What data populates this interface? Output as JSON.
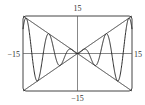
{
  "chart_data": {
    "type": "line",
    "title": "",
    "xlabel": "",
    "ylabel": "",
    "xlim": [
      -15,
      15
    ],
    "ylim": [
      -15,
      15
    ],
    "grid": false,
    "legend": null,
    "tick_labels": {
      "x_left": "−15",
      "x_right": "15",
      "y_top": "15",
      "y_bottom": "−15"
    },
    "series": [
      {
        "name": "y = x sin x",
        "expression": "x*sin(x)",
        "x_range": [
          -15,
          15
        ]
      },
      {
        "name": "y = x",
        "expression": "x",
        "x_range": [
          -15,
          15
        ]
      },
      {
        "name": "y = -x",
        "expression": "-x",
        "x_range": [
          -15,
          15
        ]
      }
    ]
  },
  "style": {
    "line_color": "#2a2a2a",
    "axis_color": "#555555",
    "frame_color": "#444444"
  }
}
